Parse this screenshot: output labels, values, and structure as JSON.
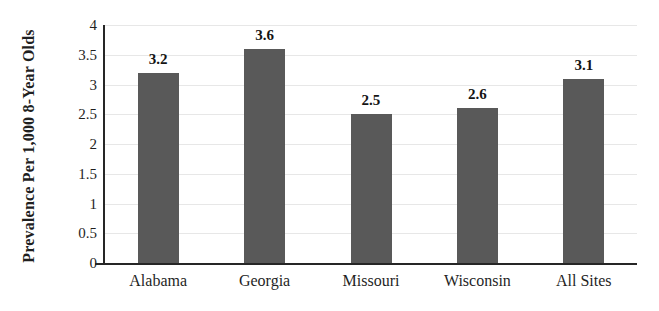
{
  "chart_data": {
    "type": "bar",
    "categories": [
      "Alabama",
      "Georgia",
      "Missouri",
      "Wisconsin",
      "All Sites"
    ],
    "values": [
      3.2,
      3.6,
      2.5,
      2.6,
      3.1
    ],
    "value_labels": [
      "3.2",
      "3.6",
      "2.5",
      "2.6",
      "3.1"
    ],
    "title": "",
    "xlabel": "",
    "ylabel": "Prevalence Per 1,000 8-Year Olds",
    "ylim": [
      0,
      4
    ],
    "y_ticks": [
      0,
      0.5,
      1,
      1.5,
      2,
      2.5,
      3,
      3.5,
      4
    ],
    "y_tick_labels": [
      "0",
      "0.5",
      "1",
      "1.5",
      "2",
      "2.5",
      "3",
      "3.5",
      "4"
    ],
    "grid": true,
    "legend": false,
    "colors": {
      "bar": "#595959",
      "gridline": "#e7e7e7",
      "axis": "#262626",
      "text": "#1f1f1f"
    }
  }
}
